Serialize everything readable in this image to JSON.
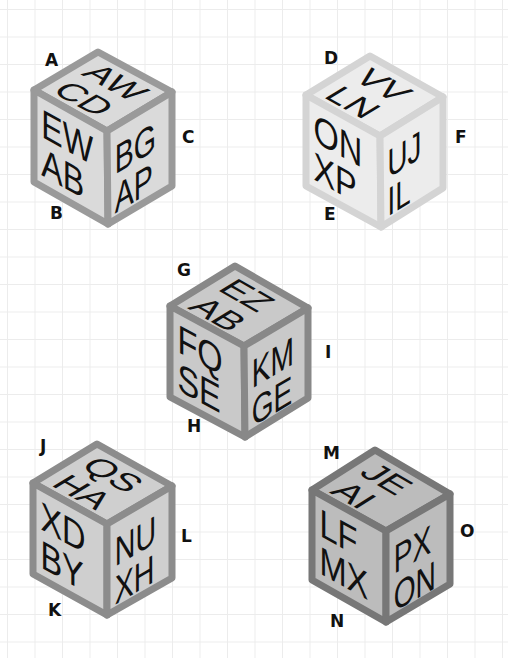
{
  "diagram": {
    "type": "isometric-letter-cubes",
    "cubes": [
      {
        "id": "cube-1",
        "vertex_labels": [
          "A",
          "B",
          "C"
        ],
        "faces": {
          "top": [
            "AW",
            "CD"
          ],
          "left": [
            "EW",
            "AB"
          ],
          "right": [
            "BG",
            "AP"
          ]
        },
        "colors": {
          "edge": "#9a9a9a",
          "face": "#dadada"
        }
      },
      {
        "id": "cube-2",
        "vertex_labels": [
          "D",
          "E",
          "F"
        ],
        "faces": {
          "top": [
            "VV",
            "LN"
          ],
          "left": [
            "ON",
            "XP"
          ],
          "right": [
            "UJ",
            "IL"
          ]
        },
        "colors": {
          "edge": "#d4d4d4",
          "face": "#ececec"
        }
      },
      {
        "id": "cube-3",
        "vertex_labels": [
          "G",
          "H",
          "I"
        ],
        "faces": {
          "top": [
            "EZ",
            "AB"
          ],
          "left": [
            "FQ",
            "SE"
          ],
          "right": [
            "KM",
            "GE"
          ]
        },
        "colors": {
          "edge": "#888888",
          "face": "#c9c9c9"
        }
      },
      {
        "id": "cube-4",
        "vertex_labels": [
          "J",
          "K",
          "L"
        ],
        "faces": {
          "top": [
            "QS",
            "HA"
          ],
          "left": [
            "XD",
            "BY"
          ],
          "right": [
            "NU",
            "XH"
          ]
        },
        "colors": {
          "edge": "#8c8c8c",
          "face": "#cfcfcf"
        }
      },
      {
        "id": "cube-5",
        "vertex_labels": [
          "M",
          "N",
          "O"
        ],
        "faces": {
          "top": [
            "JE",
            "AI"
          ],
          "left": [
            "LF",
            "MX"
          ],
          "right": [
            "PX",
            "ON"
          ]
        },
        "colors": {
          "edge": "#777777",
          "face": "#bcbcbc"
        }
      }
    ]
  }
}
